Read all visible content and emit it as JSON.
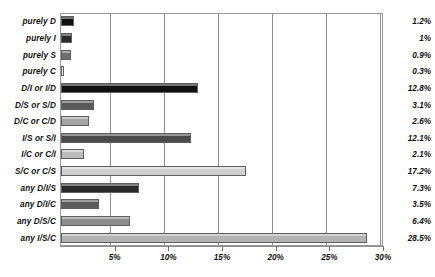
{
  "chart_data": {
    "type": "bar",
    "orientation": "horizontal",
    "title": "",
    "xlabel": "",
    "ylabel": "",
    "xlim": [
      0,
      30
    ],
    "grid": true,
    "legend": "none",
    "xticks": [
      "5%",
      "10%",
      "15%",
      "20%",
      "25%",
      "30%"
    ],
    "xtick_values": [
      5,
      10,
      15,
      20,
      25,
      30
    ],
    "categories": [
      "purely D",
      "purely I",
      "purely S",
      "purely C",
      "D/I or I/D",
      "D/S or S/D",
      "D/C or C/D",
      "I/S or S/I",
      "I/C or C/I",
      "S/C or C/S",
      "any D/I/S",
      "any D/I/C",
      "any D/S/C",
      "any I/S/C"
    ],
    "values": [
      1.2,
      1.0,
      0.9,
      0.3,
      12.8,
      3.1,
      2.6,
      12.1,
      2.1,
      17.2,
      7.3,
      3.5,
      6.4,
      28.5
    ],
    "value_labels": [
      "1.2%",
      "1%",
      "0.9%",
      "0.3%",
      "12.8%",
      "3.1%",
      "2.6%",
      "12.1%",
      "2.1%",
      "17.2%",
      "7.3%",
      "3.5%",
      "6.4%",
      "28.5%"
    ],
    "bar_colors": [
      "#121212",
      "#2b2b2b",
      "#6e6e6e",
      "#ececec",
      "#101010",
      "#5a5a5a",
      "#a5a5a5",
      "#4a4a4a",
      "#bdbdbd",
      "#cfcfcf",
      "#2a2a2a",
      "#5e5e5e",
      "#8d8d8d",
      "#b3b3b3"
    ],
    "bar_border_color": "#5f5f5f",
    "gridline_color": "#8f8f8f",
    "axis_color": "#8f8f8f",
    "background": "#ffffff"
  }
}
